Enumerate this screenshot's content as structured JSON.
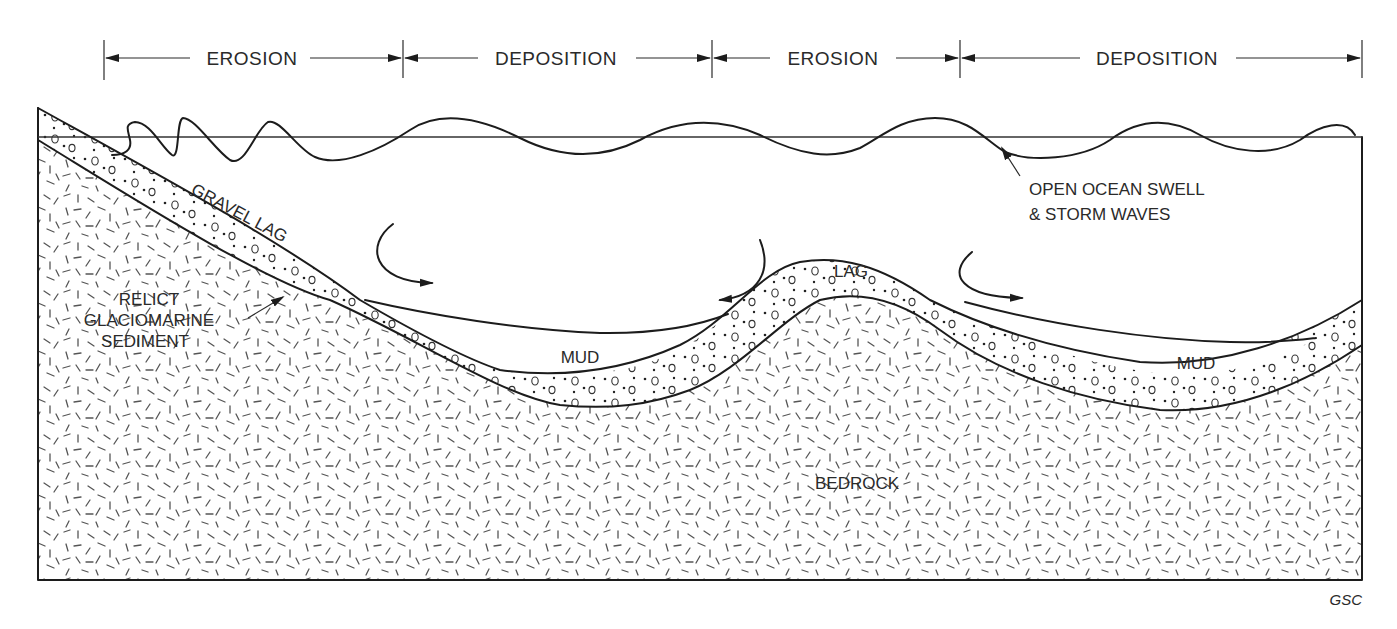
{
  "diagram": {
    "type": "geologic-cross-section",
    "zones": [
      {
        "label": "EROSION",
        "x_start": 104,
        "x_end": 403
      },
      {
        "label": "DEPOSITION",
        "x_start": 403,
        "x_end": 712
      },
      {
        "label": "EROSION",
        "x_start": 712,
        "x_end": 960
      },
      {
        "label": "DEPOSITION",
        "x_start": 960,
        "x_end": 1362
      }
    ],
    "layers": {
      "gravel_lag": "GRAVEL LAG",
      "lag": "LAG",
      "mud_left": "MUD",
      "mud_right": "MUD",
      "bedrock": "BEDROCK",
      "relict_line1": "RELICT",
      "relict_line2": "GLACIOMARINE",
      "relict_line3": "SEDIMENT"
    },
    "annotations": {
      "waves_line1": "OPEN OCEAN SWELL",
      "waves_line2": "& STORM WAVES"
    },
    "credit": "GSC",
    "colors": {
      "ink": "#1c1c1c",
      "paper": "#ffffff",
      "hatch": "#555555"
    }
  }
}
